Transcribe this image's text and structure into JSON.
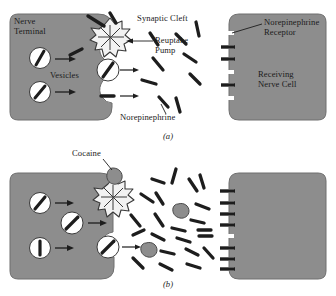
{
  "figure": {
    "title_absent": true,
    "colors": {
      "cell_fill": "#8d8d8d",
      "cell_stroke": "#6f6f6f",
      "vesicle_fill": "#ffffff",
      "vesicle_stroke": "#3a3a3a",
      "molecule": "#1d1d1d",
      "pump_fill": "#f2f2f2",
      "pump_stroke": "#3a3a3a",
      "cocaine_fill": "#8d8d8d",
      "cocaine_stroke": "#4a4a4a",
      "background": "#ffffff",
      "text": "#1b1b1b"
    }
  },
  "panel_a": {
    "caption": "(a)",
    "labels": {
      "nerve_terminal": "Nerve\nTerminal",
      "nerve_terminal_line1": "Nerve",
      "nerve_terminal_line2": "Terminal",
      "vesicles": "Vesicles",
      "synaptic_cleft": "Synaptic Cleft",
      "reuptake_pump_line1": "Reuptake",
      "reuptake_pump_line2": "Pump",
      "norepinephrine": "Norepinephrine",
      "receptor_line1": "Norepinephrine",
      "receptor_line2": "Receptor",
      "receiving_cell_line1": "Receiving",
      "receiving_cell_line2": "Nerve Cell"
    },
    "counts": {
      "vesicles": 3,
      "cleft_molecules": 9,
      "receptor_slots": 6,
      "occupied_receptors": 3
    }
  },
  "panel_b": {
    "caption": "(b)",
    "labels": {
      "cocaine": "Cocaine"
    },
    "counts": {
      "vesicles": 4,
      "cleft_molecules": 22,
      "cocaine_blobs_in_cleft": 2,
      "cocaine_blobs_on_pump": 1,
      "receptor_slots": 8,
      "occupied_receptors": 7
    }
  }
}
